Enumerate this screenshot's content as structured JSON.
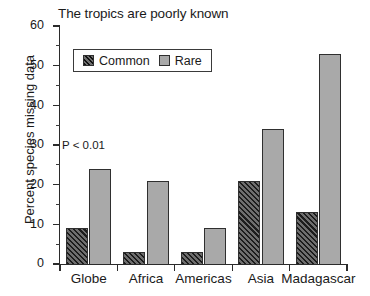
{
  "chart_data": {
    "type": "bar",
    "title": "The tropics are poorly known",
    "xlabel": "",
    "ylabel": "Percent species missing data",
    "categories": [
      "Globe",
      "Africa",
      "Americas",
      "Asia",
      "Madagascar"
    ],
    "series": [
      {
        "name": "Common",
        "values": [
          9,
          3,
          3,
          21,
          13
        ],
        "color": "#3c3c3c",
        "pattern": "diagonal-hatch"
      },
      {
        "name": "Rare",
        "values": [
          24,
          21,
          9,
          34,
          53
        ],
        "color": "#a9a9a9",
        "pattern": "solid"
      }
    ],
    "ylim": [
      0,
      60
    ],
    "ytick_major": [
      0,
      10,
      20,
      30,
      40,
      50,
      60
    ],
    "ytick_minor": [
      5,
      15,
      25,
      35,
      45,
      55
    ],
    "grid": false,
    "legend_position": "top-left-inside",
    "annotations": [
      {
        "text": "P < 0.01",
        "x_category": "Globe",
        "y_value": 27
      }
    ]
  },
  "legend": {
    "items": [
      {
        "label": "Common",
        "swatch": "common-hatch-swatch"
      },
      {
        "label": "Rare",
        "swatch": "rare-gray-swatch"
      }
    ]
  },
  "axis": {
    "y_tick_labels": [
      "60",
      "50",
      "40",
      "30",
      "20",
      "10",
      "0"
    ]
  }
}
